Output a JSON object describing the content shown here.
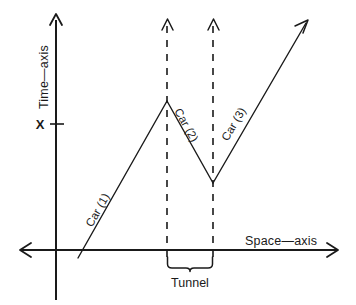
{
  "diagram": {
    "axes": {
      "vertical": {
        "label": "Time—axis",
        "name": "time-axis",
        "x": 56,
        "top_y": 14,
        "bottom_y": 300,
        "arrow": "up"
      },
      "horizontal": {
        "label": "Space—axis",
        "name": "space-axis",
        "y": 250,
        "left_x": 20,
        "right_x": 338,
        "arrow": "both"
      }
    },
    "tick": {
      "label": "X",
      "axis": "time",
      "y": 124,
      "label_x": 40
    },
    "tunnel": {
      "label": "Tunnel",
      "left_x": 167,
      "right_x": 213,
      "brace_y": 258,
      "label_y": 283
    },
    "boundaries": [
      {
        "name": "tunnel-entry-boundary",
        "x": 167,
        "top_y": 20,
        "bottom_y": 258,
        "style": "dashed",
        "arrow": "up"
      },
      {
        "name": "tunnel-exit-boundary",
        "x": 213,
        "top_y": 20,
        "bottom_y": 258,
        "style": "dashed",
        "arrow": "up"
      }
    ],
    "trajectories": [
      {
        "label": "Car (1)",
        "name": "car-1-trajectory",
        "points": [
          [
            78,
            258
          ],
          [
            167,
            101
          ]
        ],
        "label_anchor": [
          101,
          212
        ],
        "label_rotation": -60.5,
        "arrow": "none"
      },
      {
        "label": "Car (2)",
        "name": "car-2-trajectory",
        "points": [
          [
            167,
            101
          ],
          [
            213,
            183
          ]
        ],
        "label_anchor": [
          183,
          127
        ],
        "label_rotation": 60.7,
        "arrow": "none"
      },
      {
        "label": "Car (3)",
        "name": "car-3-trajectory",
        "points": [
          [
            213,
            183
          ],
          [
            308,
            20
          ]
        ],
        "label_anchor": [
          237,
          126
        ],
        "label_rotation": -59.8,
        "arrow": "up-right"
      }
    ],
    "colors": {
      "ink": "#1a1a1a",
      "background": "#ffffff"
    }
  }
}
